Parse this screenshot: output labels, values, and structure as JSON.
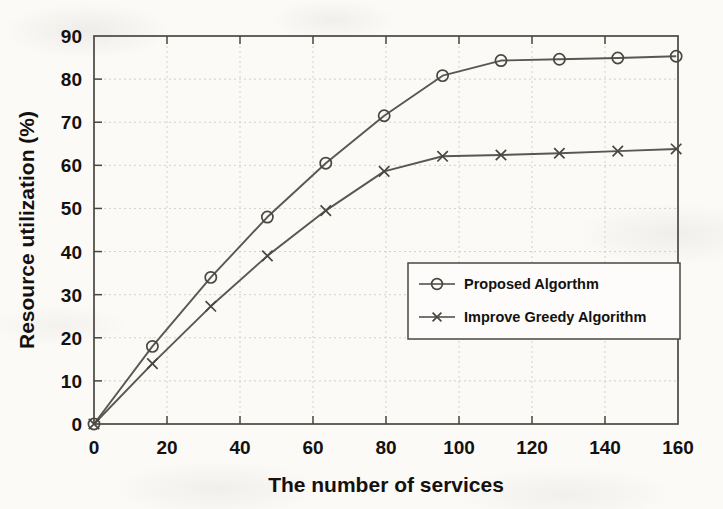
{
  "figure": {
    "background_color": "#fbfaf7",
    "ink_color": "#14110f",
    "line_color": "#4a4742",
    "grid_color": "#c9c6c0"
  },
  "chart_data": {
    "type": "line",
    "title": "",
    "xlabel": "The number of services",
    "ylabel": "Resource utilization (%)",
    "xlim": [
      0,
      160
    ],
    "ylim": [
      0,
      90
    ],
    "xticks": [
      0,
      20,
      40,
      60,
      80,
      100,
      120,
      140,
      160
    ],
    "yticks": [
      0,
      10,
      20,
      30,
      40,
      50,
      60,
      70,
      80,
      90
    ],
    "xtick_labels": [
      "0",
      "20",
      "40",
      "60",
      "80",
      "100",
      "120",
      "140",
      "160"
    ],
    "ytick_labels": [
      "0",
      "10",
      "20",
      "30",
      "40",
      "50",
      "60",
      "70",
      "80",
      "90"
    ],
    "grid": true,
    "legend_position": "center-right",
    "series": [
      {
        "name": "Proposed Algorthm",
        "marker": "circle",
        "color": "#4a4742",
        "x": [
          0,
          16,
          32,
          47.5,
          63.5,
          79.5,
          95.5,
          111.5,
          127.5,
          143.5,
          159.5
        ],
        "values": [
          0,
          18.0,
          34.0,
          48.0,
          60.5,
          71.5,
          80.8,
          84.3,
          84.6,
          84.9,
          85.3
        ]
      },
      {
        "name": "Improve Greedy Algorithm",
        "marker": "cross",
        "color": "#4a4742",
        "x": [
          0,
          16,
          32,
          47.5,
          63.5,
          79.5,
          95.5,
          111.5,
          127.5,
          143.5,
          159.5
        ],
        "values": [
          0,
          14.0,
          27.3,
          39.0,
          49.5,
          58.6,
          62.1,
          62.4,
          62.8,
          63.3,
          63.8
        ]
      }
    ]
  },
  "legend": {
    "entries": [
      {
        "label": "Proposed Algorthm",
        "marker": "circle"
      },
      {
        "label": "Improve Greedy Algorithm",
        "marker": "cross"
      }
    ]
  }
}
